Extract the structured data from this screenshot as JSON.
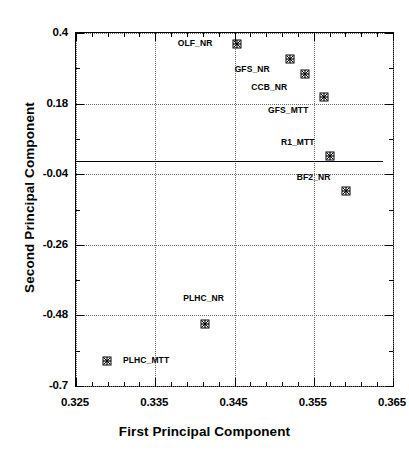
{
  "chart_data": {
    "type": "scatter",
    "title": "",
    "xlabel": "First Principal Component",
    "ylabel": "Second Principal Component",
    "xlim": [
      0.325,
      0.365
    ],
    "ylim": [
      -0.7,
      0.4
    ],
    "xticks": [
      "0.325",
      "0.335",
      "0.345",
      "0.355",
      "0.365"
    ],
    "xtick_values": [
      0.325,
      0.335,
      0.345,
      0.355,
      0.365
    ],
    "yticks": [
      "0.4",
      "0.18",
      "-0.04",
      "-0.26",
      "-0.48",
      "-0.7"
    ],
    "ytick_values": [
      0.4,
      0.18,
      -0.04,
      -0.26,
      -0.48,
      -0.7
    ],
    "grid": true,
    "grid_style": "dotted",
    "legend": "none",
    "marker": "asterisk-in-square",
    "marker_color": "#000000",
    "points": [
      {
        "label": "OLF_NR",
        "x": 0.3452,
        "y": 0.369,
        "label_dx": -41,
        "label_dy": 0
      },
      {
        "label": "GFS_NR",
        "x": 0.3519,
        "y": 0.322,
        "label_dx": -37,
        "label_dy": 11
      },
      {
        "label": "CCB_NR",
        "x": 0.3538,
        "y": 0.275,
        "label_dx": -35,
        "label_dy": 14
      },
      {
        "label": "GFS_MTT",
        "x": 0.3562,
        "y": 0.203,
        "label_dx": -35,
        "label_dy": 14
      },
      {
        "label": "R1_MTT",
        "x": 0.3569,
        "y": 0.02,
        "label_dx": -31,
        "label_dy": -13
      },
      {
        "label": "BF2_NR",
        "x": 0.3589,
        "y": -0.089,
        "label_dx": -31,
        "label_dy": -13
      },
      {
        "label": "PLHC_NR",
        "x": 0.3411,
        "y": -0.503,
        "label_dx": 0,
        "label_dy": -25
      },
      {
        "label": "PLHC_MTT",
        "x": 0.3288,
        "y": -0.618,
        "label_dx": 40,
        "label_dy": 0
      }
    ],
    "reference_line": {
      "type": "horizontal",
      "y": 0.0,
      "x_start": 0.325,
      "x_end": 0.3638,
      "style": "solid"
    }
  }
}
